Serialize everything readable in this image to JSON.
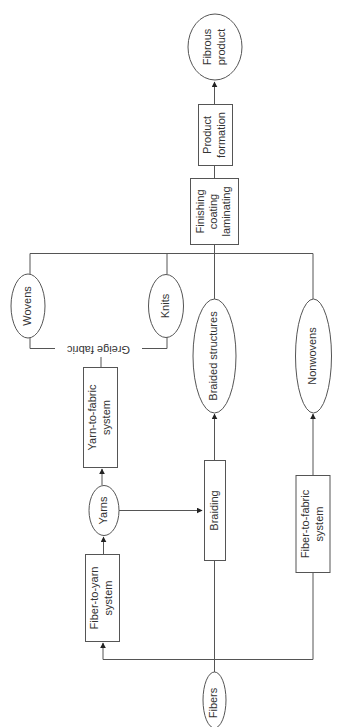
{
  "diagram": {
    "orientation": "rotated-90-ccw",
    "nodes": {
      "fibers": {
        "label": "Fibers",
        "shape": "ellipse"
      },
      "fiber_to_yarn": {
        "line1": "Fiber-to-yarn",
        "line2": "system",
        "shape": "rect"
      },
      "yarns": {
        "label": "Yarns",
        "shape": "ellipse"
      },
      "yarn_to_fabric": {
        "line1": "Yarn-to-fabric",
        "line2": "system",
        "shape": "rect"
      },
      "greige_fabric": {
        "label": "Greige fabric",
        "shape": "bracket-label"
      },
      "wovens": {
        "label": "Wovens",
        "shape": "ellipse"
      },
      "knits": {
        "label": "Knits",
        "shape": "ellipse"
      },
      "braiding": {
        "label": "Braiding",
        "shape": "rect"
      },
      "braided_structures": {
        "label": "Braided structures",
        "shape": "ellipse"
      },
      "fiber_to_fabric": {
        "line1": "Fiber-to-fabric",
        "line2": "system",
        "shape": "rect"
      },
      "nonwovens": {
        "label": "Nonwovens",
        "shape": "ellipse"
      },
      "finishing": {
        "line1": "Finishing",
        "line2": "coating",
        "line3": "laminating",
        "shape": "rect"
      },
      "product_formation": {
        "line1": "Product",
        "line2": "formation",
        "shape": "rect"
      },
      "fibrous_product": {
        "line1": "Fibrous",
        "line2": "product",
        "shape": "ellipse"
      }
    },
    "edges": [
      {
        "from": "fibers",
        "to": "fiber_to_yarn"
      },
      {
        "from": "fibers",
        "to": "braiding"
      },
      {
        "from": "fibers",
        "to": "fiber_to_fabric"
      },
      {
        "from": "fiber_to_yarn",
        "to": "yarns"
      },
      {
        "from": "yarns",
        "to": "yarn_to_fabric"
      },
      {
        "from": "yarns",
        "to": "braiding"
      },
      {
        "from": "yarn_to_fabric",
        "to": "greige_fabric"
      },
      {
        "from": "greige_fabric",
        "to": "wovens"
      },
      {
        "from": "greige_fabric",
        "to": "knits"
      },
      {
        "from": "braiding",
        "to": "braided_structures"
      },
      {
        "from": "fiber_to_fabric",
        "to": "nonwovens"
      },
      {
        "from": "wovens",
        "to": "finishing"
      },
      {
        "from": "knits",
        "to": "finishing"
      },
      {
        "from": "braided_structures",
        "to": "finishing"
      },
      {
        "from": "nonwovens",
        "to": "finishing"
      },
      {
        "from": "finishing",
        "to": "product_formation"
      },
      {
        "from": "product_formation",
        "to": "fibrous_product"
      }
    ],
    "colors": {
      "stroke": "#555555",
      "text": "#333333",
      "background": "#ffffff"
    }
  }
}
